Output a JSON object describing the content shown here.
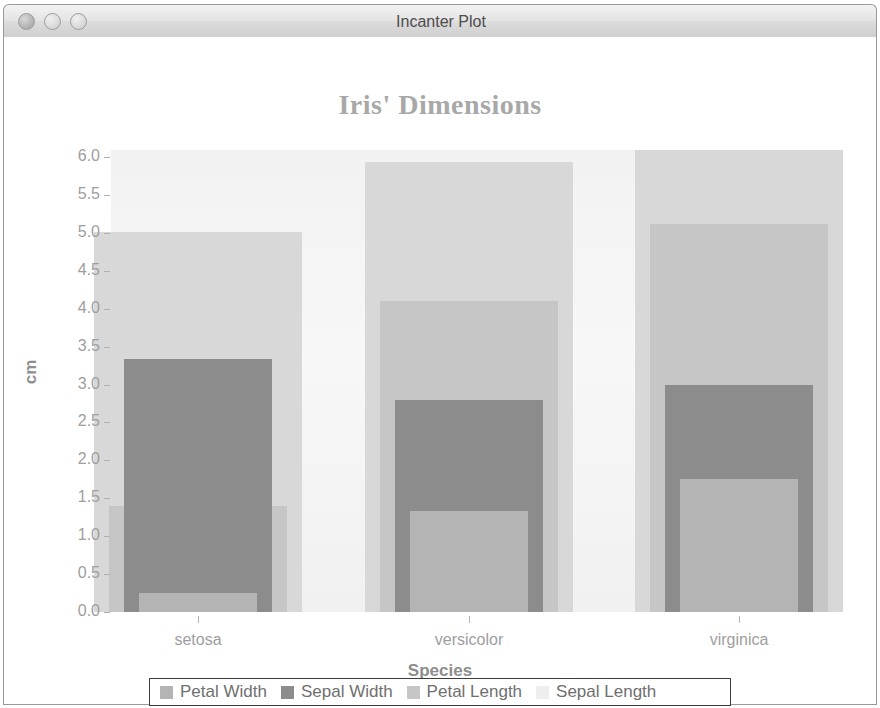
{
  "window": {
    "title": "Incanter Plot",
    "buttons": [
      {
        "name": "close",
        "label": "Close"
      },
      {
        "name": "minimize",
        "label": "Minimize"
      },
      {
        "name": "maximize",
        "label": "Maximize"
      }
    ]
  },
  "chart_data": {
    "type": "bar",
    "title": "Iris' Dimensions",
    "xlabel": "Species",
    "ylabel": "cm",
    "categories": [
      "setosa",
      "versicolor",
      "virginica"
    ],
    "ylim": [
      0.0,
      6.0
    ],
    "ytick_values": [
      0.0,
      0.5,
      1.0,
      1.5,
      2.0,
      2.5,
      3.0,
      3.5,
      4.0,
      4.5,
      5.0,
      5.5,
      6.0
    ],
    "ytick_labels": [
      "0.0",
      "0.5",
      "1.0",
      "1.5",
      "2.0",
      "2.5",
      "3.0",
      "3.5",
      "4.0",
      "4.5",
      "5.0",
      "5.5",
      "6.0"
    ],
    "grid": false,
    "legend_position": "bottom",
    "bar_style": "overlaid",
    "series": [
      {
        "name": "Petal Width",
        "values": [
          0.25,
          1.33,
          1.76
        ],
        "color": "#b4b4b4",
        "width": 118
      },
      {
        "name": "Sepal Width",
        "values": [
          3.33,
          2.8,
          3.0
        ],
        "color": "#8c8c8c",
        "width": 148
      },
      {
        "name": "Petal Length",
        "values": [
          1.4,
          4.1,
          5.12
        ],
        "color": "#c6c6c6",
        "width": 178
      },
      {
        "name": "Sepal Length",
        "values": [
          5.01,
          5.94,
          6.59
        ],
        "color": "#d8d8d8",
        "width": 208
      }
    ],
    "legend_entries": [
      {
        "label": "Petal Width",
        "color": "#b4b4b4"
      },
      {
        "label": "Sepal Width",
        "color": "#8c8c8c"
      },
      {
        "label": "Petal Length",
        "color": "#c6c6c6"
      },
      {
        "label": "Sepal Length",
        "color": "#eeeeee"
      }
    ]
  }
}
